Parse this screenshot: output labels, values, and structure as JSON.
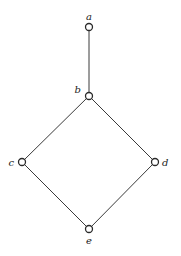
{
  "diagram": {
    "type": "hasse-diagram",
    "nodes": [
      {
        "id": "a",
        "label": "a",
        "x": 89,
        "y": 27,
        "label_x": 89,
        "label_y": 20,
        "anchor": "middle"
      },
      {
        "id": "b",
        "label": "b",
        "x": 89,
        "y": 96,
        "label_x": 81,
        "label_y": 93,
        "anchor": "end"
      },
      {
        "id": "c",
        "label": "c",
        "x": 22,
        "y": 162,
        "label_x": 14,
        "label_y": 166,
        "anchor": "end"
      },
      {
        "id": "d",
        "label": "d",
        "x": 155,
        "y": 162,
        "label_x": 162,
        "label_y": 166,
        "anchor": "start"
      },
      {
        "id": "e",
        "label": "e",
        "x": 89,
        "y": 229,
        "label_x": 89,
        "label_y": 244,
        "anchor": "middle"
      }
    ],
    "edges": [
      {
        "from": "a",
        "to": "b"
      },
      {
        "from": "b",
        "to": "c"
      },
      {
        "from": "b",
        "to": "d"
      },
      {
        "from": "c",
        "to": "e"
      },
      {
        "from": "d",
        "to": "e"
      }
    ],
    "node_radius": 3.5
  }
}
